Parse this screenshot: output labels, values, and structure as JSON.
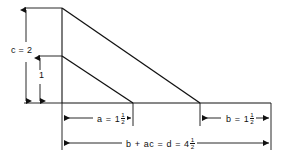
{
  "figure": {
    "type": "geometric-dimension-diagram",
    "stroke_color": "#111111",
    "background_color": "#ffffff",
    "labels": {
      "height_c": {
        "text": "c = 2",
        "value": 2,
        "symbol": "c",
        "orientation": "vertical-dimension"
      },
      "height_inner": {
        "text": "1",
        "value": 1,
        "symbol": "",
        "orientation": "vertical-dimension"
      },
      "width_a": {
        "prefix": "a = 1",
        "whole": "1",
        "symbol": "a",
        "numerator": "1",
        "denominator": "2",
        "value": 1.5,
        "orientation": "horizontal-dimension"
      },
      "width_b": {
        "prefix": "b = 1",
        "whole": "1",
        "symbol": "b",
        "numerator": "1",
        "denominator": "2",
        "value": 1.5,
        "orientation": "horizontal-dimension"
      },
      "total_d": {
        "prefix": "b + ac = d = 4",
        "expression": "b + ac = d",
        "whole": "4",
        "numerator": "1",
        "denominator": "2",
        "value": 4.5,
        "orientation": "horizontal-dimension"
      }
    },
    "geometry": {
      "apex_top": [
        62,
        8
      ],
      "apex_inner": [
        62,
        56
      ],
      "baseline_y": 103,
      "axis_x": 62,
      "outer_foot_x": 200,
      "inner_foot_x": 133,
      "baseline_right_x": 271,
      "dim_line_mid_y": 118,
      "dim_line_bottom_y": 143,
      "c_arrow_x": 26,
      "inner_arrow_x": 40
    }
  }
}
